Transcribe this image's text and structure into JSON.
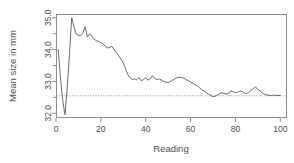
{
  "chart_data": {
    "type": "line",
    "title": "",
    "xlabel": "Reading",
    "ylabel": "Mean size in mm",
    "xlim": [
      0,
      103
    ],
    "ylim": [
      31.85,
      35.12
    ],
    "xticks": [
      0,
      20,
      40,
      60,
      80,
      100
    ],
    "xtick_labels": [
      "0",
      "20",
      "40",
      "60",
      "80",
      "100"
    ],
    "yticks": [
      32.0,
      33.0,
      34.0,
      35.0
    ],
    "ytick_labels": [
      "32.0",
      "33.0",
      "34.0",
      "35.0"
    ],
    "minor_yticks": [
      32.5,
      33.5,
      34.5
    ],
    "grid": false,
    "legend": null,
    "reference_line": {
      "orientation": "horizontal",
      "value": 32.55,
      "style": "dotted",
      "color": "#777777"
    },
    "series": [
      {
        "name": "Cumulative mean size",
        "color": "#5a5a5a",
        "x": [
          1,
          2,
          3,
          4,
          5,
          6,
          7,
          8,
          9,
          10,
          11,
          12,
          13,
          14,
          15,
          16,
          17,
          18,
          19,
          20,
          21,
          22,
          23,
          24,
          25,
          26,
          27,
          28,
          29,
          30,
          31,
          32,
          33,
          34,
          35,
          36,
          37,
          38,
          39,
          40,
          41,
          42,
          43,
          44,
          45,
          46,
          47,
          48,
          49,
          50,
          51,
          52,
          53,
          54,
          55,
          56,
          57,
          58,
          59,
          60,
          61,
          62,
          63,
          64,
          65,
          66,
          67,
          68,
          69,
          70,
          71,
          72,
          73,
          74,
          75,
          76,
          77,
          78,
          79,
          80,
          81,
          82,
          83,
          84,
          85,
          86,
          87,
          88,
          89,
          90,
          91,
          92,
          93,
          94,
          95,
          96,
          97,
          98,
          99,
          100
        ],
        "y": [
          34.0,
          33.1,
          32.4,
          31.95,
          32.8,
          33.85,
          35.0,
          34.72,
          34.48,
          34.45,
          34.44,
          34.52,
          34.72,
          34.4,
          34.5,
          34.42,
          34.33,
          34.28,
          34.26,
          34.22,
          34.18,
          34.1,
          34.05,
          34.08,
          34.1,
          33.98,
          33.9,
          33.8,
          33.7,
          33.58,
          33.4,
          33.22,
          33.12,
          33.06,
          33.08,
          33.05,
          33.12,
          33.02,
          33.06,
          33.12,
          33.04,
          33.08,
          33.18,
          33.1,
          33.06,
          33.08,
          33.04,
          33.0,
          32.98,
          32.96,
          33.0,
          33.04,
          33.08,
          33.12,
          33.13,
          33.12,
          33.1,
          33.06,
          33.02,
          32.98,
          32.94,
          32.9,
          32.86,
          32.8,
          32.74,
          32.7,
          32.64,
          32.6,
          32.56,
          32.52,
          32.54,
          32.58,
          32.62,
          32.64,
          32.62,
          32.6,
          32.64,
          32.7,
          32.68,
          32.64,
          32.66,
          32.7,
          32.68,
          32.64,
          32.62,
          32.66,
          32.72,
          32.78,
          32.82,
          32.76,
          32.7,
          32.64,
          32.6,
          32.58,
          32.56,
          32.56,
          32.57,
          32.56,
          32.56,
          32.56
        ]
      }
    ]
  },
  "geometry": {
    "plot_left": 56,
    "plot_right": 287,
    "plot_top": 14,
    "plot_bottom": 118,
    "x_zero_px": 57,
    "x_hundred_px": 282,
    "y_32_px": 115,
    "y_35_px": 17
  }
}
